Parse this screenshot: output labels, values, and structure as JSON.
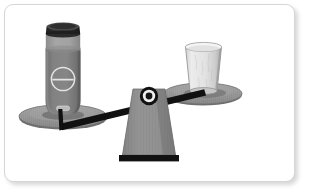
{
  "scene": {
    "title": "balance-scale-illustration",
    "description": "A two-pan balance scale tipped to the left",
    "background_color": "#ffffff",
    "frame": {
      "border_color": "#d6d6d6",
      "corner_radius": "9",
      "shadow": "true"
    }
  },
  "palette": {
    "beam_black": "#111111",
    "fulcrum_gray": "#8e8e8e",
    "fulcrum_edge": "#6f6f6f",
    "fulcrum_base_black": "#111111",
    "pan_gray": "#9a9a9a",
    "pan_gray_dark": "#7d7d7d",
    "pan_gray_light": "#b4b4b4",
    "bottle_body": "#7f7f7f",
    "bottle_body_shade": "#6a6a6a",
    "bottle_neck": "#9e9e9e",
    "bottle_cap": "#2b2b2b",
    "bottle_cap_top": "#555555",
    "label_stroke": "#e8e8e8",
    "cup_body": "#e3e3e3",
    "cup_shade": "#c8c8c8",
    "cup_rim": "#f2f2f2",
    "cup_outline": "#8a8a8a"
  },
  "objects": {
    "left_pan": {
      "name": "left-balance-pan",
      "state": "lowered",
      "holds": "bottle"
    },
    "right_pan": {
      "name": "right-balance-pan",
      "state": "raised",
      "holds": "paper-cup"
    },
    "bottle": {
      "name": "gray-bottle",
      "cap_color": "#2b2b2b",
      "body_color": "#7f7f7f",
      "has_circular_label": "true",
      "has_bottom_tag": "true"
    },
    "cup": {
      "name": "paper-cup",
      "body_color": "#e3e3e3",
      "shape": "tapered"
    },
    "fulcrum": {
      "name": "triangular-fulcrum",
      "color": "#8e8e8e",
      "base_color": "#111111"
    },
    "pivot": {
      "name": "pivot-bolt",
      "outer_color": "#111111",
      "ring_color": "#efefef",
      "center_color": "#151515"
    },
    "beam": {
      "name": "balance-beam",
      "color": "#111111",
      "tilt": "left-down"
    }
  }
}
